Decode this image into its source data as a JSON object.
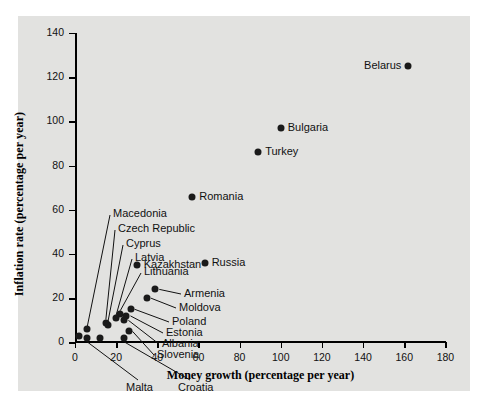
{
  "chart_data": {
    "type": "scatter",
    "title": "",
    "xlabel": "Money growth (percentage per year)",
    "ylabel": "Inflation rate (percentage per year)",
    "xlim": [
      0,
      180
    ],
    "ylim": [
      0,
      140
    ],
    "xticks": [
      0,
      20,
      40,
      60,
      80,
      100,
      120,
      140,
      160,
      180
    ],
    "yticks": [
      0,
      20,
      40,
      60,
      80,
      100,
      120,
      140
    ],
    "grid": false,
    "legend": "none",
    "point_color": "#1a1a1a",
    "plot_background": "#ffffff",
    "figure_background": "#e2e2e0",
    "points": [
      {
        "name": "Belarus",
        "x": 162,
        "y": 125,
        "label_side": "left"
      },
      {
        "name": "Bulgaria",
        "x": 100,
        "y": 97,
        "label_side": "right"
      },
      {
        "name": "Turkey",
        "x": 89,
        "y": 86,
        "label_side": "right"
      },
      {
        "name": "Romania",
        "x": 57,
        "y": 66,
        "label_side": "right"
      },
      {
        "name": "Russia",
        "x": 63,
        "y": 36,
        "label_side": "right"
      },
      {
        "name": "Kazakhstan",
        "x": 30,
        "y": 35,
        "label_side": "right"
      },
      {
        "name": "Armenia",
        "x": 39,
        "y": 24,
        "label_side": "leader"
      },
      {
        "name": "Moldova",
        "x": 35,
        "y": 20,
        "label_side": "leader"
      },
      {
        "name": "Poland",
        "x": 27,
        "y": 15,
        "label_side": "leader"
      },
      {
        "name": "Estonia",
        "x": 25,
        "y": 12,
        "label_side": "leader"
      },
      {
        "name": "Albania",
        "x": 24,
        "y": 10,
        "label_side": "leader"
      },
      {
        "name": "Slovenia",
        "x": 26,
        "y": 5,
        "label_side": "leader"
      },
      {
        "name": "Lithuania",
        "x": 22,
        "y": 13,
        "label_side": "leader"
      },
      {
        "name": "Latvia",
        "x": 20,
        "y": 11,
        "label_side": "leader"
      },
      {
        "name": "Cyprus",
        "x": 16,
        "y": 8,
        "label_side": "leader"
      },
      {
        "name": "Czech Republic",
        "x": 15,
        "y": 9,
        "label_side": "leader"
      },
      {
        "name": "Macedonia",
        "x": 6,
        "y": 6,
        "label_side": "leader"
      },
      {
        "name": "Malta",
        "x": 6,
        "y": 2,
        "label_side": "leader-down"
      },
      {
        "name": "Croatia",
        "x": 24,
        "y": 2,
        "label_side": "leader-down"
      },
      {
        "name": "unlabeled-1",
        "x": 2,
        "y": 3,
        "label_side": "none"
      },
      {
        "name": "unlabeled-2",
        "x": 12,
        "y": 2,
        "label_side": "none"
      }
    ],
    "stacked_labels": [
      {
        "name": "Macedonia",
        "tx": 95,
        "ty": 198
      },
      {
        "name": "Czech Republic",
        "tx": 100,
        "ty": 213
      },
      {
        "name": "Cyprus",
        "tx": 108,
        "ty": 228
      },
      {
        "name": "Latvia",
        "tx": 117,
        "ty": 242
      },
      {
        "name": "Lithuania",
        "tx": 126,
        "ty": 256
      }
    ],
    "right_labels": [
      {
        "name": "Armenia",
        "tx": 166,
        "ty": 278
      },
      {
        "name": "Moldova",
        "tx": 161,
        "ty": 292
      },
      {
        "name": "Poland",
        "tx": 154,
        "ty": 306
      },
      {
        "name": "Estonia",
        "tx": 148,
        "ty": 317
      },
      {
        "name": "Albania",
        "tx": 144,
        "ty": 328
      },
      {
        "name": "Slovenia",
        "tx": 139,
        "ty": 339
      }
    ],
    "below_labels": [
      {
        "name": "Malta",
        "tx": 108,
        "ty": 372
      },
      {
        "name": "Croatia",
        "tx": 160,
        "ty": 372
      }
    ]
  }
}
